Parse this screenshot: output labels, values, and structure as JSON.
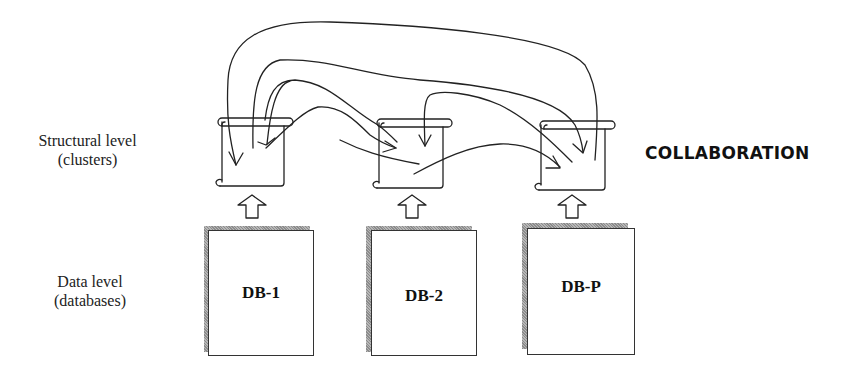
{
  "levels": {
    "structural": {
      "line1": "Structural level",
      "line2": "(clusters)"
    },
    "data": {
      "line1": "Data level",
      "line2": "(databases)"
    }
  },
  "title": "COLLABORATION",
  "databases": [
    {
      "label": "DB-1"
    },
    {
      "label": "DB-2"
    },
    {
      "label": "DB-P"
    }
  ],
  "clusters": [
    {
      "icon": "scroll-icon"
    },
    {
      "icon": "scroll-icon"
    },
    {
      "icon": "scroll-icon"
    }
  ],
  "colors": {
    "stroke": "#222222",
    "shadow": "#888888",
    "background": "#ffffff"
  }
}
